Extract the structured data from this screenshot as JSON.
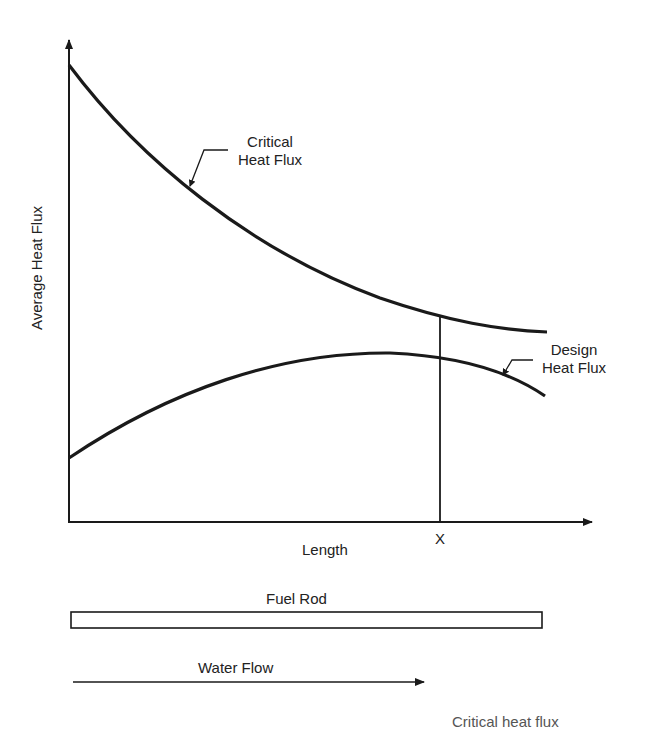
{
  "diagram": {
    "y_axis_label": "Average Heat Flux",
    "x_axis_label": "Length",
    "marker_label": "X",
    "curves": {
      "critical": {
        "line1": "Critical",
        "line2": "Heat Flux"
      },
      "design": {
        "line1": "Design",
        "line2": "Heat Flux"
      }
    },
    "fuel_rod_label": "Fuel Rod",
    "water_flow_label": "Water Flow",
    "truncated_caption": "Critical heat flux"
  },
  "colors": {
    "line": "#1a1a1a",
    "background": "#ffffff"
  }
}
